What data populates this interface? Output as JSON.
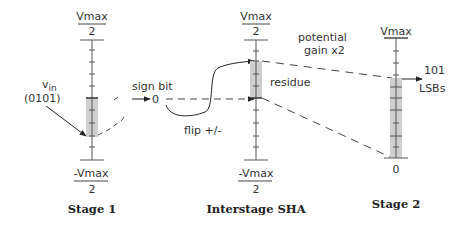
{
  "diagram": {
    "stage1": {
      "title": "Stage 1",
      "top_label_num": "Vmax",
      "top_label_den": "2",
      "bottom_label_num": "-Vmax",
      "bottom_label_den": "2",
      "input_label": "v",
      "input_subscript": "in",
      "input_code": "(0101)"
    },
    "sign_bit": {
      "label": "sign bit",
      "value": "0",
      "flip_label": "flip +/-"
    },
    "sha": {
      "title": "Interstage SHA",
      "top_label_num": "Vmax",
      "top_label_den": "2",
      "bottom_label_num": "-Vmax",
      "bottom_label_den": "2",
      "residue_label": "residue"
    },
    "gain": {
      "line1": "potential",
      "line2": "gain x2"
    },
    "stage2": {
      "title": "Stage 2",
      "top_label": "Vmax",
      "bottom_label": "0",
      "output_value": "101",
      "output_unit": "LSBs"
    },
    "colors": {
      "line": "#333333",
      "shade": "#cfcfcf",
      "text": "#333333"
    }
  }
}
